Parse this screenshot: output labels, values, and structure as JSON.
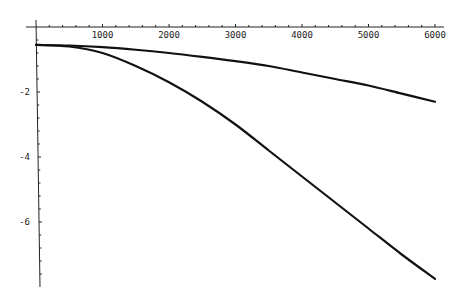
{
  "chart_data": {
    "type": "line",
    "title": "",
    "xlabel": "",
    "ylabel": "",
    "xlim": [
      0,
      6100
    ],
    "ylim": [
      -7.9,
      0.05
    ],
    "grid": false,
    "legend": null,
    "x_ticks": [
      1000,
      2000,
      3000,
      4000,
      5000,
      6000
    ],
    "x_tick_labels": [
      "1000",
      "2000",
      "3000",
      "4000",
      "5000",
      "6000"
    ],
    "y_ticks": [
      -2,
      -4,
      -6
    ],
    "y_tick_labels": [
      "-2",
      "-4",
      "-6"
    ],
    "x": [
      0,
      500,
      1000,
      1500,
      2000,
      2500,
      3000,
      3500,
      4000,
      4500,
      5000,
      5500,
      6000
    ],
    "series": [
      {
        "name": "upper curve",
        "values": [
          -0.55,
          -0.57,
          -0.62,
          -0.7,
          -0.8,
          -0.92,
          -1.05,
          -1.2,
          -1.4,
          -1.6,
          -1.8,
          -2.05,
          -2.3
        ]
      },
      {
        "name": "lower curve",
        "values": [
          -0.55,
          -0.6,
          -0.8,
          -1.2,
          -1.7,
          -2.3,
          -3.0,
          -3.8,
          -4.6,
          -5.4,
          -6.2,
          -7.0,
          -7.75
        ]
      }
    ],
    "colors": {
      "line": "#111111",
      "axis": "#222222",
      "background": "#ffffff"
    }
  }
}
